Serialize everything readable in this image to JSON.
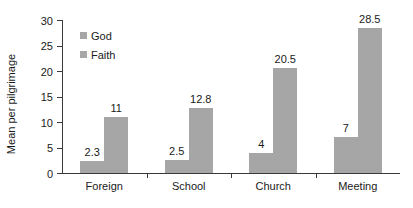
{
  "chart_data": {
    "type": "bar",
    "title": "",
    "xlabel": "",
    "ylabel": "Mean per pilgrimage",
    "categories": [
      "Foreign",
      "School",
      "Church",
      "Meeting"
    ],
    "series": [
      {
        "name": "God",
        "values": [
          2.3,
          2.5,
          4,
          7
        ]
      },
      {
        "name": "Faith",
        "values": [
          11,
          12.8,
          20.5,
          28.5
        ]
      }
    ],
    "value_labels": {
      "God": [
        "2.3",
        "2.5",
        "4",
        "7"
      ],
      "Faith": [
        "11",
        "12.8",
        "20.5",
        "28.5"
      ]
    },
    "ylim": [
      0,
      30
    ],
    "yticks": [
      0,
      5,
      10,
      15,
      20,
      25,
      30
    ],
    "ytick_labels": [
      "0",
      "5",
      "10",
      "15",
      "20",
      "25",
      "30"
    ],
    "grid": false,
    "legend_position": "upper-left-inside",
    "colors": {
      "bar": "#a6a6a6",
      "axis": "#3a3a3a",
      "text": "#1a1a1a",
      "background": "#ffffff"
    }
  }
}
